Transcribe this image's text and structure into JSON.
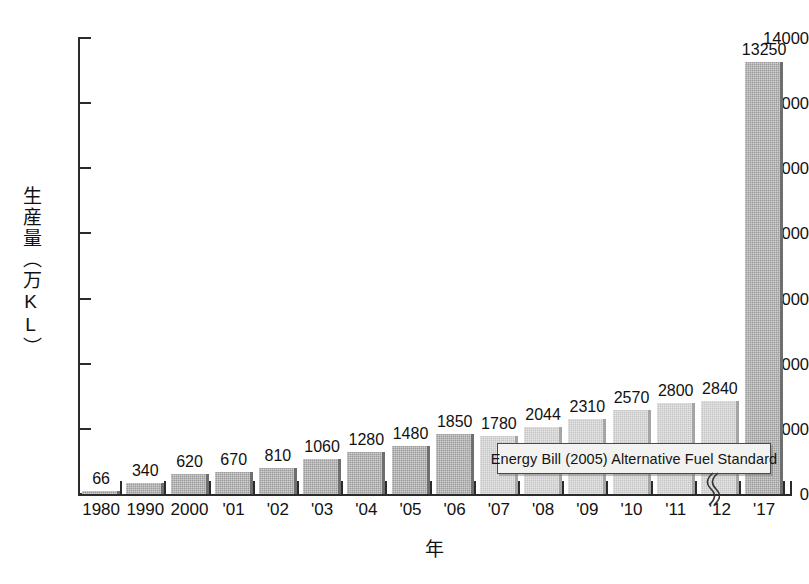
{
  "chart_data": {
    "type": "bar",
    "title": "",
    "xlabel": "年",
    "ylabel": "生産量（万KL）",
    "ylim": [
      0,
      14000
    ],
    "ytick_values": [
      0,
      2000,
      4000,
      6000,
      8000,
      10000,
      12000,
      14000
    ],
    "ytick_labels": [
      "0",
      "2000",
      "4000",
      "6000",
      "8000",
      "10000",
      "12000",
      "14000"
    ],
    "grid": false,
    "legend": "none",
    "categories": [
      "1980",
      "1990",
      "2000",
      "'01",
      "'02",
      "'03",
      "'04",
      "'05",
      "'06",
      "'07",
      "'08",
      "'09",
      "'10",
      "'11",
      "'12",
      "'17"
    ],
    "values": [
      66,
      340,
      620,
      670,
      810,
      1060,
      1280,
      1480,
      1850,
      1780,
      2044,
      2310,
      2570,
      2800,
      2840,
      13250
    ],
    "value_labels": [
      "66",
      "340",
      "620",
      "670",
      "810",
      "1060",
      "1280",
      "1480",
      "1850",
      "1780",
      "2044",
      "2310",
      "2570",
      "2800",
      "2840",
      "13250"
    ],
    "series_groups": [
      {
        "name": "actual",
        "color": "#9a9a9a",
        "from_index": 0,
        "to_index": 8
      },
      {
        "name": "projected",
        "color": "#c6c6c6",
        "from_index": 9,
        "to_index": 14
      },
      {
        "name": "target",
        "color": "#9a9a9a",
        "from_index": 15,
        "to_index": 15
      }
    ],
    "annotations": [
      {
        "text": "Energy Bill (2005) Alternative Fuel Standard",
        "kind": "callout-box"
      }
    ],
    "axis_break": {
      "between": [
        "'12",
        "'17"
      ],
      "symbol": "(("
    }
  },
  "axis": {
    "y_title": "生産量（万KL）",
    "x_title": "年"
  },
  "annotation": {
    "energy_bill": "Energy Bill (2005) Alternative Fuel Standard"
  }
}
